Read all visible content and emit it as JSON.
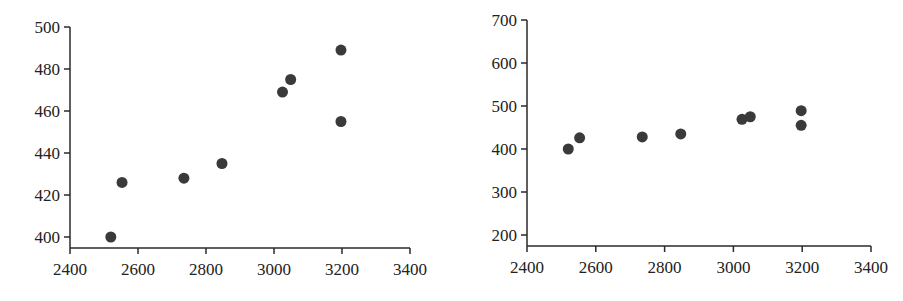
{
  "chart_data": [
    {
      "type": "scatter",
      "title": "",
      "xlabel": "",
      "ylabel": "",
      "xlim": [
        2400,
        3400
      ],
      "ylim": [
        395,
        500
      ],
      "x_ticks": [
        "2400",
        "2600",
        "2800",
        "3000",
        "3200",
        "3400"
      ],
      "y_ticks": [
        "400",
        "420",
        "440",
        "460",
        "480",
        "500"
      ],
      "grid": false,
      "legend": null,
      "points": [
        {
          "x": 2520,
          "y": 400
        },
        {
          "x": 2553,
          "y": 426
        },
        {
          "x": 2735,
          "y": 428
        },
        {
          "x": 2847,
          "y": 435
        },
        {
          "x": 3025,
          "y": 469
        },
        {
          "x": 3049,
          "y": 475
        },
        {
          "x": 3197,
          "y": 489
        },
        {
          "x": 3197,
          "y": 455
        }
      ]
    },
    {
      "type": "scatter",
      "title": "",
      "xlabel": "",
      "ylabel": "",
      "xlim": [
        2400,
        3400
      ],
      "ylim": [
        175,
        700
      ],
      "x_ticks": [
        "2400",
        "2600",
        "2800",
        "3000",
        "3200",
        "3400"
      ],
      "y_ticks": [
        "200",
        "300",
        "400",
        "500",
        "600",
        "700"
      ],
      "grid": false,
      "legend": null,
      "points": [
        {
          "x": 2520,
          "y": 400
        },
        {
          "x": 2553,
          "y": 426
        },
        {
          "x": 2735,
          "y": 428
        },
        {
          "x": 2847,
          "y": 435
        },
        {
          "x": 3025,
          "y": 469
        },
        {
          "x": 3049,
          "y": 475
        },
        {
          "x": 3197,
          "y": 489
        },
        {
          "x": 3197,
          "y": 455
        }
      ]
    }
  ],
  "colors": {
    "axis": "#2a2a2a",
    "marker": "#3a3a3a",
    "text": "#222222",
    "background": "#ffffff"
  }
}
